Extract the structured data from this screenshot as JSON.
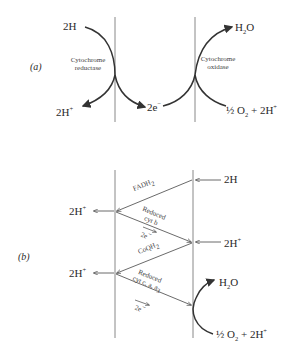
{
  "panel_a": {
    "label": "(a)",
    "left_top": "2H",
    "left_bottom": "2H",
    "left_bottom_sup": "+",
    "enzyme_left_1": "Cytochrome",
    "enzyme_left_2": "reductase",
    "middle": "2e",
    "middle_sup": "−",
    "enzyme_right_1": "Cytochrome",
    "enzyme_right_2": "oxidase",
    "right_top": "H",
    "right_top_sub": "2",
    "right_top_tail": "O",
    "right_bottom_frac": "½",
    "right_bottom_o": " O",
    "right_bottom_sub": "2",
    "right_bottom_tail": " + 2H",
    "right_bottom_sup": "+"
  },
  "panel_b": {
    "label": "(b)",
    "left_upper": "2H",
    "left_upper_sup": "+",
    "left_lower": "2H",
    "left_lower_sup": "+",
    "right_upper": "2H",
    "right_middle": "2H",
    "right_middle_sup": "+",
    "fadh": "FADH",
    "fadh_sub": "2",
    "reduced_1": "Reduced",
    "cyt_b": "cyt b",
    "e1": "2e",
    "e1_sup": "−",
    "coqh": "CoQH",
    "coqh_sub": "2",
    "reduced_2": "Reduced",
    "cyt_caa": "cyt c, a, a",
    "cyt_caa_sub": "3",
    "e2": "2e",
    "e2_sup": "−",
    "right_top": "H",
    "right_top_sub": "2",
    "right_top_tail": "O",
    "right_bottom_frac": "½",
    "right_bottom_o": " O",
    "right_bottom_sub": "2",
    "right_bottom_tail": " + 2H",
    "right_bottom_sup": "+"
  },
  "colors": {
    "line": "#7a7a7a",
    "arrow": "#333333",
    "text": "#2a2a2a"
  }
}
